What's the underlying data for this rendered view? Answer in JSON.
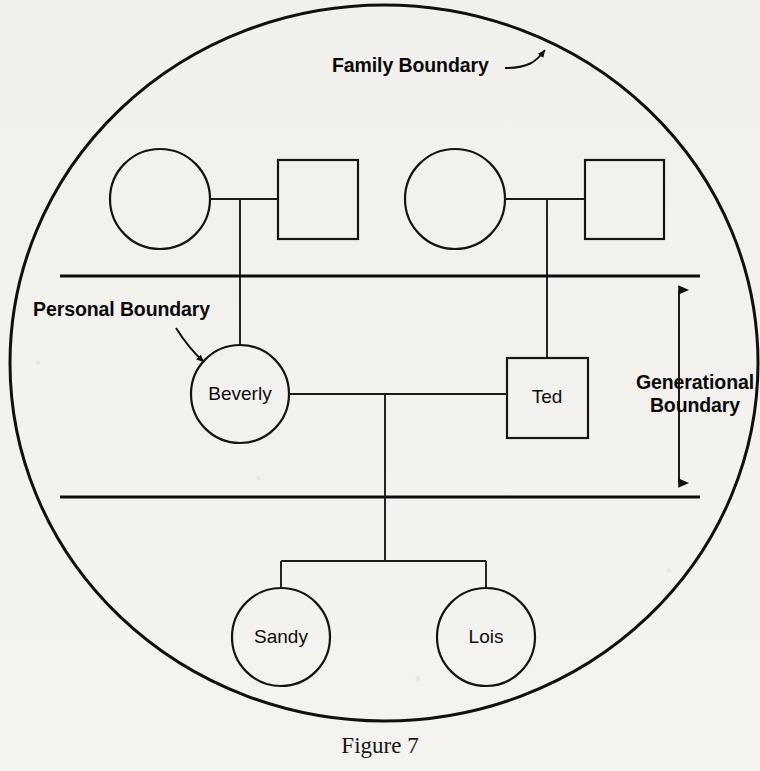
{
  "figure": {
    "caption": "Figure 7",
    "type": "genogram"
  },
  "annotations": {
    "family_boundary": {
      "label": "Family Boundary",
      "x": 332,
      "y": 72
    },
    "personal_boundary": {
      "label": "Personal Boundary",
      "x": 33,
      "y": 316
    },
    "generational_boundary": {
      "line1": "Generational",
      "line2": "Boundary",
      "x": 695,
      "y1": 389,
      "y2": 412
    }
  },
  "boundaries": {
    "family_ring": {
      "cx": 384,
      "cy": 363,
      "rx": 374,
      "ry": 358
    },
    "generational_lines": [
      {
        "name": "upper-generational-line",
        "x1": 60,
        "x2": 700,
        "y": 276
      },
      {
        "name": "lower-generational-line",
        "x1": 60,
        "x2": 700,
        "y": 497
      }
    ],
    "dimension_arrow": {
      "x": 679,
      "y_top": 277,
      "y_bottom": 496
    }
  },
  "generations": [
    {
      "name": "grandparents",
      "members": [
        {
          "id": "gp1-female",
          "shape": "circle",
          "label": "",
          "cx": 160,
          "cy": 199,
          "r": 50
        },
        {
          "id": "gp1-male",
          "shape": "square",
          "label": "",
          "x": 278,
          "y": 160,
          "w": 80,
          "h": 79
        },
        {
          "id": "gp2-female",
          "shape": "circle",
          "label": "",
          "cx": 455,
          "cy": 199,
          "r": 50
        },
        {
          "id": "gp2-male",
          "shape": "square",
          "label": "",
          "x": 585,
          "y": 160,
          "w": 79,
          "h": 79
        }
      ]
    },
    {
      "name": "parents",
      "members": [
        {
          "id": "beverly",
          "shape": "circle",
          "label": "Beverly",
          "cx": 240,
          "cy": 394,
          "r": 49
        },
        {
          "id": "ted",
          "shape": "square",
          "label": "Ted",
          "x": 507,
          "y": 358,
          "w": 81,
          "h": 80
        }
      ]
    },
    {
      "name": "children",
      "members": [
        {
          "id": "sandy",
          "shape": "circle",
          "label": "Sandy",
          "cx": 281,
          "cy": 637,
          "r": 49
        },
        {
          "id": "lois",
          "shape": "circle",
          "label": "Lois",
          "cx": 486,
          "cy": 637,
          "r": 49
        }
      ]
    }
  ],
  "colors": {
    "ink": "#101010",
    "paper": "#f3f2ef"
  }
}
